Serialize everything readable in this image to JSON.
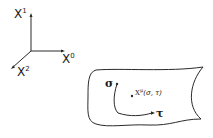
{
  "axes": {
    "x1_label": "X",
    "x1_sup": "1",
    "x0_label": "X",
    "x0_sup": "0",
    "x2_label": "X",
    "x2_sup": "2"
  },
  "worldsheet": {
    "sigma_label": "σ",
    "tau_label": "τ",
    "point_label": "X",
    "point_sup": "μ",
    "point_args": "(σ, τ)"
  },
  "colors": {
    "stroke": "#2a2a2a",
    "background": "#ffffff"
  }
}
